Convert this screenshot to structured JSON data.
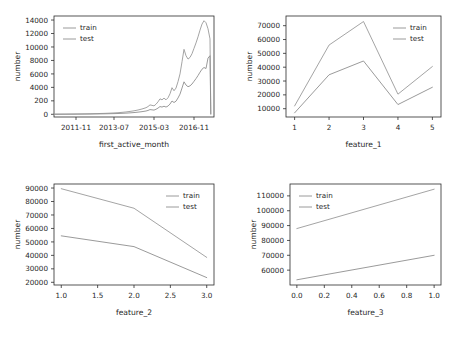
{
  "figure": {
    "background": "#ffffff",
    "line_color": "#8f8f8f",
    "axis_color": "#2b2b2b",
    "rows": 2,
    "cols": 2
  },
  "chart_data": [
    {
      "type": "line",
      "id": "first_active_month",
      "title": "",
      "xlabel": "first_active_month",
      "ylabel": "number",
      "grid": false,
      "legend_position": "upper left",
      "xtick_labels": [
        "2011-11",
        "2013-07",
        "2015-03",
        "2016-11"
      ],
      "xtick_positions": [
        11,
        30,
        50,
        70
      ],
      "xlim": [
        0,
        80
      ],
      "ytick_labels": [
        "0",
        "200",
        "4000",
        "6000",
        "8000",
        "10000",
        "12000",
        "14000"
      ],
      "ytick_values": [
        0,
        2000,
        4000,
        6000,
        8000,
        10000,
        12000,
        14000
      ],
      "ylim": [
        -400,
        14600
      ],
      "x": [
        0,
        2,
        4,
        6,
        8,
        10,
        12,
        14,
        16,
        18,
        20,
        22,
        24,
        26,
        28,
        30,
        32,
        34,
        36,
        38,
        40,
        42,
        44,
        46,
        47,
        48,
        49,
        50,
        51,
        52,
        53,
        54,
        55,
        56,
        57,
        58,
        59,
        60,
        61,
        62,
        63,
        64,
        65,
        66,
        67,
        68,
        69,
        70,
        71,
        72,
        73,
        74,
        75,
        76,
        77,
        78,
        78.4
      ],
      "series": [
        {
          "name": "train",
          "values": [
            20,
            25,
            30,
            35,
            40,
            45,
            55,
            60,
            70,
            80,
            95,
            110,
            130,
            150,
            175,
            205,
            240,
            290,
            350,
            430,
            520,
            640,
            790,
            980,
            1150,
            1400,
            1330,
            1250,
            1500,
            1850,
            2300,
            2150,
            2400,
            2150,
            2450,
            3050,
            3950,
            3500,
            3900,
            4850,
            6000,
            7800,
            9650,
            8700,
            8200,
            8450,
            9000,
            9800,
            10600,
            11500,
            12500,
            13400,
            13900,
            13600,
            12700,
            11200,
            60
          ]
        },
        {
          "name": "test",
          "values": [
            10,
            12,
            15,
            18,
            20,
            23,
            27,
            30,
            35,
            40,
            48,
            55,
            65,
            75,
            88,
            103,
            120,
            145,
            175,
            215,
            260,
            320,
            395,
            490,
            575,
            700,
            665,
            625,
            750,
            925,
            1150,
            1075,
            1200,
            1075,
            1225,
            1525,
            1975,
            1750,
            1950,
            2425,
            3000,
            3900,
            4825,
            4350,
            4100,
            4225,
            4500,
            4900,
            5300,
            5750,
            6250,
            6700,
            6950,
            6800,
            8350,
            8700,
            30
          ]
        }
      ]
    },
    {
      "type": "line",
      "id": "feature_1",
      "title": "",
      "xlabel": "feature_1",
      "ylabel": "number",
      "grid": false,
      "legend_position": "upper right",
      "xtick_labels": [
        "1",
        "2",
        "3",
        "4",
        "5"
      ],
      "xtick_positions": [
        1,
        2,
        3,
        4,
        5
      ],
      "xlim": [
        0.75,
        5.25
      ],
      "ytick_labels": [
        "10000",
        "20000",
        "30000",
        "40000",
        "50000",
        "60000",
        "70000"
      ],
      "ytick_values": [
        10000,
        20000,
        30000,
        40000,
        50000,
        60000,
        70000
      ],
      "ylim": [
        4000,
        77000
      ],
      "x": [
        1,
        2,
        3,
        4,
        5
      ],
      "series": [
        {
          "name": "train",
          "values": [
            12000,
            56000,
            73000,
            20500,
            40500
          ]
        },
        {
          "name": "test",
          "values": [
            7000,
            34500,
            44500,
            13000,
            25500
          ]
        }
      ]
    },
    {
      "type": "line",
      "id": "feature_2",
      "title": "",
      "xlabel": "feature_2",
      "ylabel": "number",
      "grid": false,
      "legend_position": "upper right",
      "xtick_labels": [
        "1.0",
        "1.5",
        "2.0",
        "2.5",
        "3.0"
      ],
      "xtick_positions": [
        1.0,
        1.5,
        2.0,
        2.5,
        3.0
      ],
      "xlim": [
        0.9,
        3.1
      ],
      "ytick_labels": [
        "20000",
        "30000",
        "40000",
        "50000",
        "60000",
        "70000",
        "80000",
        "90000"
      ],
      "ytick_values": [
        20000,
        30000,
        40000,
        50000,
        60000,
        70000,
        80000,
        90000
      ],
      "ylim": [
        18000,
        93000
      ],
      "x": [
        1.0,
        2.0,
        3.0
      ],
      "series": [
        {
          "name": "train",
          "values": [
            89500,
            75000,
            38500
          ]
        },
        {
          "name": "test",
          "values": [
            54500,
            46500,
            23500
          ]
        }
      ]
    },
    {
      "type": "line",
      "id": "feature_3",
      "title": "",
      "xlabel": "feature_3",
      "ylabel": "number",
      "grid": false,
      "legend_position": "upper left",
      "xtick_labels": [
        "0.0",
        "0.2",
        "0.4",
        "0.6",
        "0.8",
        "1.0"
      ],
      "xtick_positions": [
        0.0,
        0.2,
        0.4,
        0.6,
        0.8,
        1.0
      ],
      "xlim": [
        -0.05,
        1.05
      ],
      "ytick_labels": [
        "60000",
        "70000",
        "80000",
        "90000",
        "100000",
        "110000"
      ],
      "ytick_values": [
        60000,
        70000,
        80000,
        90000,
        100000,
        110000
      ],
      "ylim": [
        50000,
        118000
      ],
      "x": [
        0.0,
        1.0
      ],
      "series": [
        {
          "name": "train",
          "values": [
            88000,
            114500
          ]
        },
        {
          "name": "test",
          "values": [
            53500,
            70000
          ]
        }
      ]
    }
  ],
  "legend": {
    "train_label": "train",
    "test_label": "test"
  }
}
